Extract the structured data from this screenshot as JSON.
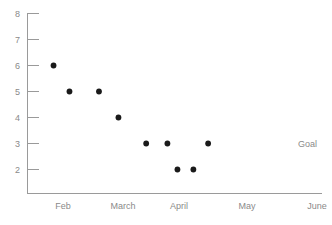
{
  "chart_data": {
    "type": "scatter",
    "title": "",
    "subtitle": "",
    "xlabel": "",
    "ylabel": "",
    "grid": false,
    "legend_position": "none",
    "xlim": [
      0,
      5
    ],
    "ylim": [
      1,
      8
    ],
    "y_ticks": [
      8,
      7,
      6,
      5,
      4,
      3,
      2
    ],
    "x_tick_labels": [
      "Feb",
      "March",
      "April",
      "May",
      "June"
    ],
    "series": [
      {
        "name": "measurements",
        "marker": "filled-circle",
        "color": "#1a1a1a",
        "points": [
          {
            "x": 0.45,
            "y": 6
          },
          {
            "x": 0.72,
            "y": 5
          },
          {
            "x": 1.22,
            "y": 5
          },
          {
            "x": 1.55,
            "y": 4
          },
          {
            "x": 2.02,
            "y": 3
          },
          {
            "x": 2.38,
            "y": 3
          },
          {
            "x": 2.55,
            "y": 2
          },
          {
            "x": 2.82,
            "y": 2
          },
          {
            "x": 3.07,
            "y": 3
          }
        ]
      }
    ],
    "annotations": [
      {
        "text": "Goal",
        "y": 3,
        "x_anchor": "right-of-axis",
        "color": "#8a8a8a"
      }
    ],
    "axis_color": "#9a9a9a",
    "tick_label_color": "#8a8a8a",
    "point_color": "#1a1a1a",
    "background_color": "#ffffff"
  },
  "y_tick_labels": {
    "t8": "8",
    "t7": "7",
    "t6": "6",
    "t5": "5",
    "t4": "4",
    "t3": "3",
    "t2": "2"
  },
  "x_tick_labels": {
    "feb": "Feb",
    "march": "March",
    "april": "April",
    "may": "May",
    "june": "June"
  },
  "annotations": {
    "goal": "Goal"
  }
}
